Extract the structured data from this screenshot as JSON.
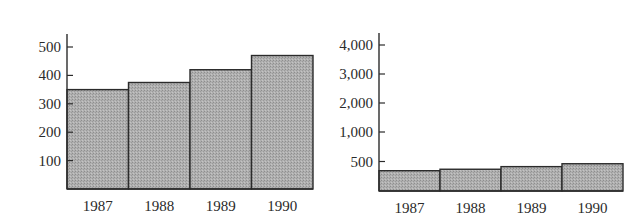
{
  "chart_data": [
    {
      "type": "bar",
      "title": "",
      "xlabel": "",
      "ylabel": "",
      "categories": [
        "1987",
        "1988",
        "1989",
        "1990"
      ],
      "values": [
        350,
        375,
        420,
        470
      ],
      "ylim": [
        0,
        540
      ],
      "yticks": [
        100,
        200,
        300,
        400,
        500
      ],
      "ytick_labels": [
        "100",
        "200",
        "300",
        "400",
        "500"
      ],
      "grid": false,
      "legend": null,
      "bar_color": "#a8a8a8",
      "edge_color": "#2b2b2b"
    },
    {
      "type": "bar",
      "title": "",
      "xlabel": "",
      "ylabel": "",
      "categories": [
        "1987",
        "1988",
        "1989",
        "1990"
      ],
      "values": [
        350,
        375,
        420,
        470
      ],
      "ylim": [
        0,
        4400
      ],
      "yticks": [
        500,
        1000,
        2000,
        3000,
        4000
      ],
      "ytick_labels": [
        "500",
        "1,000",
        "2,000",
        "3,000",
        "4,000"
      ],
      "grid": false,
      "legend": null,
      "bar_color": "#a8a8a8",
      "edge_color": "#2b2b2b"
    }
  ]
}
